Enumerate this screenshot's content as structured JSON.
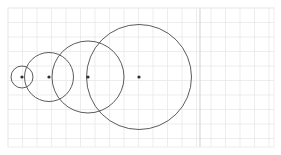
{
  "figure": {
    "title": "",
    "background_color": "#ffffff",
    "width": 281,
    "height": 155
  },
  "chart_data": {
    "type": "scatter",
    "title": "",
    "subtitle": "",
    "xlabel": "",
    "ylabel": "",
    "xlim": [
      0,
      18.8
    ],
    "ylim": [
      0,
      9.6
    ],
    "grid": true,
    "grid_color": "#e8e8e8",
    "grid_spacing": 14.5,
    "legend": null,
    "legend_position": "none",
    "axis_frame": {
      "left": 8,
      "top": 8,
      "right": 274,
      "bottom": 147,
      "color": "#eeeeee",
      "visible": true
    },
    "marker_color": "#303030",
    "circle_stroke_color": "#4a4a4a",
    "circle_stroke_width": 0.9,
    "circle_fill": "none",
    "annotations": [],
    "series": [
      {
        "name": "nested circles",
        "kind": "circles",
        "points": [
          {
            "label": "c1",
            "cx": 22,
            "cy": 77,
            "r": 11
          },
          {
            "label": "c2",
            "cx": 49,
            "cy": 77,
            "r": 24.5
          },
          {
            "label": "c3",
            "cx": 88,
            "cy": 77,
            "r": 36
          },
          {
            "label": "c4",
            "cx": 139,
            "cy": 77,
            "r": 52.5
          }
        ]
      }
    ],
    "center_markers": {
      "name": "circle centers",
      "radius": 1.6,
      "x": [
        22,
        49,
        88,
        139
      ],
      "y": [
        77,
        77,
        77,
        77
      ]
    },
    "vertical_guides": [
      {
        "x": 200,
        "color": "#d8d8d8",
        "width": 1.2
      }
    ],
    "xticks": [],
    "yticks": [],
    "xticklabels": [],
    "yticklabels": []
  }
}
